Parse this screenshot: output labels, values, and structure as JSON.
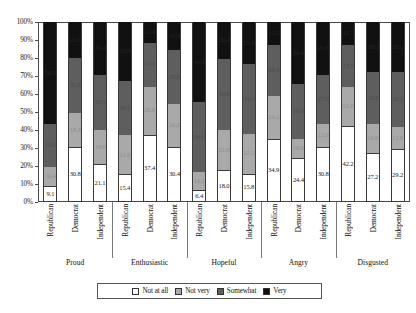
{
  "chart_data": {
    "type": "bar",
    "subtype": "100% stacked bar",
    "title": "",
    "xlabel": "",
    "ylabel": "",
    "ylim": [
      0,
      100
    ],
    "ytick_labels": [
      "0%",
      "10%",
      "20%",
      "30%",
      "40%",
      "50%",
      "60%",
      "70%",
      "80%",
      "90%",
      "100%"
    ],
    "ytick_values": [
      0,
      10,
      20,
      30,
      40,
      50,
      60,
      70,
      80,
      90,
      100
    ],
    "grid": false,
    "legend_position": "bottom",
    "stack_order_bottom_to_top": [
      "Not at all",
      "Not very",
      "Somewhat",
      "Very"
    ],
    "series": [
      {
        "name": "Not at all",
        "color": "#ffffff",
        "values": [
          9.1,
          30.8,
          21.1,
          15.4,
          37.4,
          30.4,
          6.4,
          18.0,
          15.8,
          34.9,
          24.4,
          30.8,
          42.2,
          27.2,
          29.2
        ]
      },
      {
        "name": "Not very",
        "color": "#a9a9a9",
        "values": [
          10.4,
          18.4,
          19.0,
          21.6,
          26.6,
          24.0,
          10.2,
          21.8,
          22.2,
          24.2,
          10.6,
          12.6,
          21.6,
          16.0,
          12.6
        ]
      },
      {
        "name": "Somewhat",
        "color": "#5e5e5e",
        "values": [
          24.0,
          30.8,
          30.5,
          30.2,
          24.6,
          29.8,
          39.0,
          39.8,
          38.6,
          28.4,
          30.4,
          27.0,
          23.5,
          28.8,
          30.2
        ]
      },
      {
        "name": "Very",
        "color": "#111111",
        "values": [
          56.5,
          20.0,
          29.4,
          32.8,
          11.4,
          15.8,
          44.4,
          20.4,
          23.4,
          12.5,
          34.6,
          29.6,
          12.7,
          28.0,
          28.0
        ]
      }
    ],
    "groups": [
      {
        "label": "Proud",
        "categories": [
          "Republican",
          "Democrat",
          "Independent"
        ]
      },
      {
        "label": "Enthusiastic",
        "categories": [
          "Republican",
          "Democrat",
          "Independent"
        ]
      },
      {
        "label": "Hopeful",
        "categories": [
          "Republican",
          "Democrat",
          "Independent"
        ]
      },
      {
        "label": "Angry",
        "categories": [
          "Republican",
          "Democrat",
          "Independent"
        ]
      },
      {
        "label": "Disgusted",
        "categories": [
          "Republican",
          "Democrat",
          "Independent"
        ]
      }
    ],
    "categories": [
      "Republican",
      "Democrat",
      "Independent",
      "Republican",
      "Democrat",
      "Independent",
      "Republican",
      "Democrat",
      "Independent",
      "Republican",
      "Democrat",
      "Independent",
      "Republican",
      "Democrat",
      "Independent"
    ],
    "bar_labels": [
      {
        "not_at_all": "9.1",
        "not_very": "10.4",
        "somewhat": "24.0",
        "very": "56.5"
      },
      {
        "not_at_all": "30.8",
        "not_very": "18.4",
        "somewhat": "30.8",
        "very": "20.0"
      },
      {
        "not_at_all": "21.1",
        "not_very": "19.0",
        "somewhat": "30.5",
        "very": "29.4"
      },
      {
        "not_at_all": "15.4",
        "not_very": "21.6",
        "somewhat": "30.2",
        "very": "32.8"
      },
      {
        "not_at_all": "37.4",
        "not_very": "26.6",
        "somewhat": "24.6",
        "very": "11.4"
      },
      {
        "not_at_all": "30.4",
        "not_very": "24.0",
        "somewhat": "29.8",
        "very": "15.8"
      },
      {
        "not_at_all": "6.4",
        "not_very": "10.2",
        "somewhat": "39.0",
        "very": "44.4"
      },
      {
        "not_at_all": "18.0",
        "not_very": "21.8",
        "somewhat": "39.8",
        "very": "20.4"
      },
      {
        "not_at_all": "15.8",
        "not_very": "22.2",
        "somewhat": "38.6",
        "very": "23.4"
      },
      {
        "not_at_all": "34.9",
        "not_very": "24.2",
        "somewhat": "28.4",
        "very": "12.5"
      },
      {
        "not_at_all": "24.4",
        "not_very": "10.6",
        "somewhat": "30.4",
        "very": "34.6"
      },
      {
        "not_at_all": "30.8",
        "not_very": "12.6",
        "somewhat": "27.0",
        "very": "29.6"
      },
      {
        "not_at_all": "42.2",
        "not_very": "21.6",
        "somewhat": "23.5",
        "very": "12.7"
      },
      {
        "not_at_all": "27.2",
        "not_very": "16.0",
        "somewhat": "28.8",
        "very": "28.0"
      },
      {
        "not_at_all": "29.2",
        "not_very": "12.6",
        "somewhat": "30.2",
        "very": "28.0"
      }
    ],
    "legend": [
      "Not at all",
      "Not very",
      "Somewhat",
      "Very"
    ]
  }
}
